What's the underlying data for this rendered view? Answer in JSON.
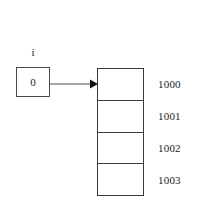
{
  "diagram": {
    "variable": {
      "name": "i",
      "value": "0"
    },
    "arrow": {
      "icon": "right-arrow-icon"
    },
    "array": {
      "cells": [
        {
          "address": "1000",
          "value": ""
        },
        {
          "address": "1001",
          "value": ""
        },
        {
          "address": "1002",
          "value": ""
        },
        {
          "address": "1003",
          "value": ""
        }
      ]
    },
    "colors": {
      "stroke": "#3c3c3c",
      "var_stroke": "#4a4a4a",
      "text": "#1a1a1a",
      "background": "#ffffff"
    }
  }
}
